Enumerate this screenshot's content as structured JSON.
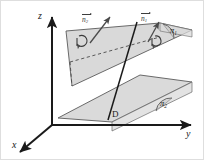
{
  "figure": {
    "background_color": "#ffffff",
    "stroke_color": "#1a1a1a",
    "plane_fill_color": "#d6d6d6",
    "plane_edge_color": "#555555",
    "vector_color": "#3d3d3d"
  },
  "axes": {
    "x": {
      "label": "x"
    },
    "y": {
      "label": "y"
    },
    "z": {
      "label": "z"
    }
  },
  "planes": [
    {
      "id": "pi1",
      "label": "π",
      "subscript": "1"
    },
    {
      "id": "pi2",
      "label": "π",
      "subscript": "2"
    }
  ],
  "vectors": [
    {
      "id": "n2",
      "label": "n",
      "subscript": "2"
    },
    {
      "id": "n1",
      "label": "n",
      "subscript": "1"
    }
  ],
  "intersection_line": {
    "label": "D"
  },
  "angles": [
    {
      "id": "angle-pi1",
      "marker": "arc"
    },
    {
      "id": "angle-pi2",
      "marker": "arc"
    },
    {
      "id": "angle-upper-plane",
      "marker": "curved-arrow"
    },
    {
      "id": "angle-normal-n1",
      "marker": "curved-arrow"
    }
  ]
}
